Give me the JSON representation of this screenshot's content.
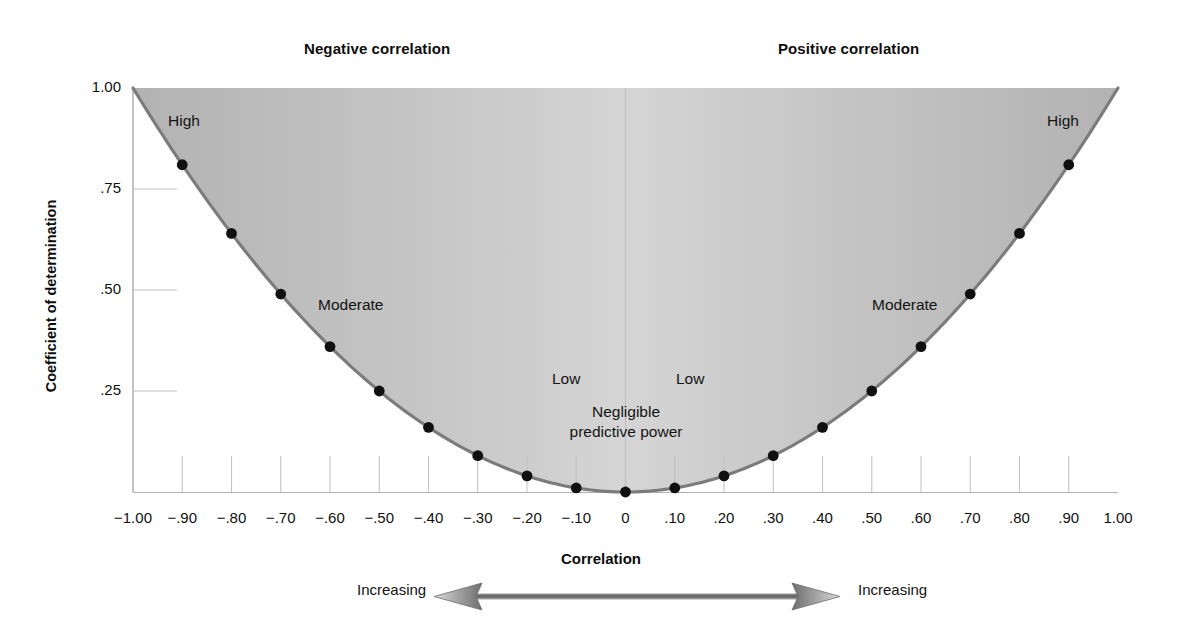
{
  "headings": {
    "negative": "Negative correlation",
    "positive": "Positive correlation"
  },
  "axes": {
    "y_title": "Coefficient of determination",
    "x_title": "Correlation",
    "y_ticks": [
      "1.00",
      ".75",
      ".50",
      ".25"
    ],
    "x_ticks": [
      "−1.00",
      "−.90",
      "−.80",
      "−.70",
      "−.60",
      "−.50",
      "−.40",
      "−.30",
      "−.20",
      "−.10",
      "0",
      ".10",
      ".20",
      ".30",
      ".40",
      ".50",
      ".60",
      ".70",
      ".80",
      ".90",
      "1.00"
    ]
  },
  "annotations": {
    "high_left": "High",
    "high_right": "High",
    "moderate_left": "Moderate",
    "moderate_right": "Moderate",
    "low_left": "Low",
    "low_right": "Low",
    "negligible_line1": "Negligible",
    "negligible_line2": "predictive power",
    "increasing_left": "Increasing",
    "increasing_right": "Increasing"
  },
  "colors": {
    "curve": "#7b7b7b",
    "point": "#101010",
    "fill_edge": "#b4b4b4",
    "fill_center": "#fbfbfb",
    "axis": "#9a9a9a",
    "text": "#111111"
  },
  "chart_data": {
    "type": "line",
    "xlabel": "Correlation",
    "ylabel": "Coefficient of determination",
    "xlim": [
      -1.0,
      1.0
    ],
    "ylim": [
      0.0,
      1.0
    ],
    "grid": false,
    "legend": null,
    "relationship": "r_squared = r^2",
    "x": [
      -1.0,
      -0.9,
      -0.8,
      -0.7,
      -0.6,
      -0.5,
      -0.4,
      -0.3,
      -0.2,
      -0.1,
      0.0,
      0.1,
      0.2,
      0.3,
      0.4,
      0.5,
      0.6,
      0.7,
      0.8,
      0.9,
      1.0
    ],
    "y": [
      1.0,
      0.81,
      0.64,
      0.49,
      0.36,
      0.25,
      0.16,
      0.09,
      0.04,
      0.01,
      0.0,
      0.01,
      0.04,
      0.09,
      0.16,
      0.25,
      0.36,
      0.49,
      0.64,
      0.81,
      1.0
    ],
    "markers_at_x": [
      -0.9,
      -0.8,
      -0.7,
      -0.6,
      -0.5,
      -0.4,
      -0.3,
      -0.2,
      -0.1,
      0.0,
      0.1,
      0.2,
      0.3,
      0.4,
      0.5,
      0.6,
      0.7,
      0.8,
      0.9
    ],
    "markers_at_y": [
      0.81,
      0.64,
      0.49,
      0.36,
      0.25,
      0.16,
      0.09,
      0.04,
      0.01,
      0.0,
      0.01,
      0.04,
      0.09,
      0.16,
      0.25,
      0.36,
      0.49,
      0.64,
      0.81
    ],
    "x_tick_values": [
      -1.0,
      -0.9,
      -0.8,
      -0.7,
      -0.6,
      -0.5,
      -0.4,
      -0.3,
      -0.2,
      -0.1,
      0.0,
      0.1,
      0.2,
      0.3,
      0.4,
      0.5,
      0.6,
      0.7,
      0.8,
      0.9,
      1.0
    ],
    "y_tick_values": [
      1.0,
      0.75,
      0.5,
      0.25
    ],
    "shaded_region": "area above the parabola (between curve and y = 1.00)",
    "annotations": [
      {
        "text": "Negative correlation",
        "x": -0.66,
        "y": 1.08
      },
      {
        "text": "Positive correlation",
        "x": 0.31,
        "y": 1.08
      },
      {
        "text": "High",
        "x": -0.86,
        "y": 0.9
      },
      {
        "text": "High",
        "x": 0.93,
        "y": 0.9
      },
      {
        "text": "Moderate",
        "x": -0.56,
        "y": 0.46
      },
      {
        "text": "Moderate",
        "x": 0.56,
        "y": 0.46
      },
      {
        "text": "Low",
        "x": -0.14,
        "y": 0.27
      },
      {
        "text": "Low",
        "x": 0.12,
        "y": 0.27
      },
      {
        "text": "Negligible predictive power",
        "x": 0.0,
        "y": 0.2
      }
    ]
  }
}
